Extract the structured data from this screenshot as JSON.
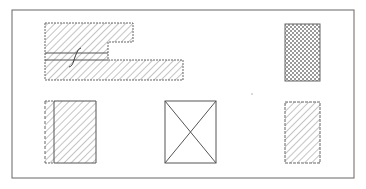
{
  "diagram": {
    "type": "technical-drawing-section-symbols",
    "colors": {
      "background": "#ffffff",
      "line": "#555555",
      "hatch": "#8a8a8a",
      "frame": "#666666"
    },
    "frame": {
      "x": 12,
      "y": 10,
      "width": 342,
      "height": 168
    },
    "shapes": [
      {
        "id": "stepped-section",
        "hatch": "diagonal",
        "border": "dashed",
        "annotation": "break-line-S"
      },
      {
        "id": "crosshatch-rect",
        "hatch": "cross",
        "border": "solid"
      },
      {
        "id": "partial-hatch-rect",
        "hatch": "diagonal",
        "border": "solid",
        "left_edge": "dashed"
      },
      {
        "id": "x-box",
        "hatch": "none",
        "border": "solid",
        "diagonals": true
      },
      {
        "id": "dashed-hatch-rect",
        "hatch": "diagonal",
        "border": "dashed"
      }
    ]
  }
}
